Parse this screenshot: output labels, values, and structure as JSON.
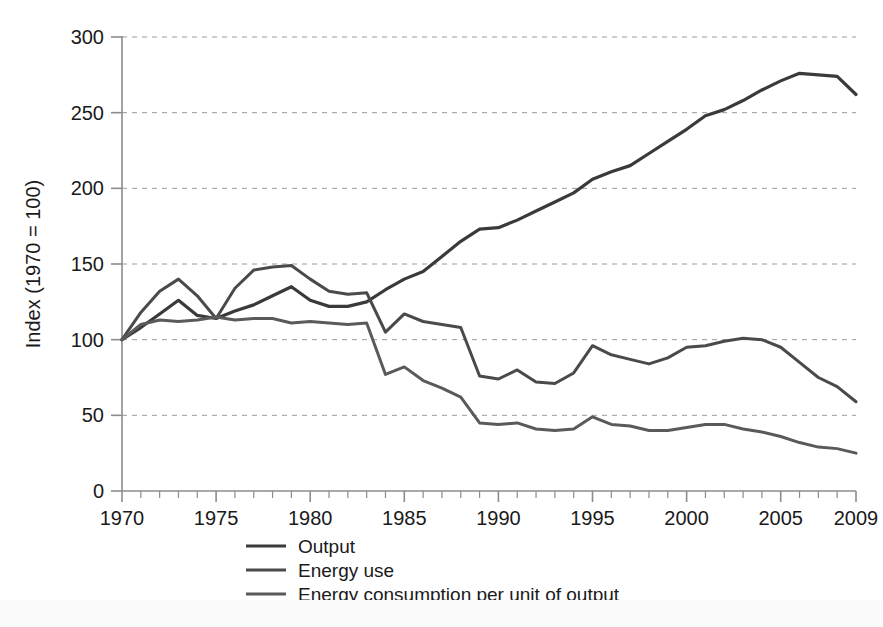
{
  "figure": {
    "background_color": "#ffffff",
    "axis_color": "#8c8c8c",
    "grid_color": "#9a9aa0",
    "text_color": "#1a1a1a"
  },
  "chart_data": {
    "type": "line",
    "title": "",
    "subtitle": "",
    "xlabel": "",
    "ylabel": "Index (1970 = 100)",
    "xlim": [
      1970,
      2009
    ],
    "ylim": [
      0,
      300
    ],
    "grid": true,
    "grid_axis": "y",
    "grid_style": "dashed",
    "legend_position": "bottom-center",
    "xticks": [
      1970,
      1975,
      1980,
      1985,
      1990,
      1995,
      2000,
      2005,
      2009
    ],
    "xtick_labels": [
      "1970",
      "1975",
      "1980",
      "1985",
      "1990",
      "1995",
      "2000",
      "2005",
      "2009"
    ],
    "xminor_tick_interval": 1,
    "yticks": [
      0,
      50,
      100,
      150,
      200,
      250,
      300
    ],
    "ytick_labels": [
      "0",
      "50",
      "100",
      "150",
      "200",
      "250",
      "300"
    ],
    "x": [
      1970,
      1971,
      1972,
      1973,
      1974,
      1975,
      1976,
      1977,
      1978,
      1979,
      1980,
      1981,
      1982,
      1983,
      1984,
      1985,
      1986,
      1987,
      1988,
      1989,
      1990,
      1991,
      1992,
      1993,
      1994,
      1995,
      1996,
      1997,
      1998,
      1999,
      2000,
      2001,
      2002,
      2003,
      2004,
      2005,
      2006,
      2007,
      2008,
      2009
    ],
    "series": [
      {
        "name": "Output",
        "color": "#3a3a3a",
        "width": 3.2,
        "values": [
          100,
          108,
          117,
          126,
          116,
          114,
          119,
          123,
          129,
          135,
          126,
          122,
          122,
          125,
          133,
          140,
          145,
          155,
          165,
          173,
          174,
          179,
          185,
          191,
          197,
          206,
          211,
          215,
          223,
          231,
          239,
          248,
          252,
          258,
          265,
          271,
          276,
          275,
          274,
          262
        ]
      },
      {
        "name": "Energy use",
        "color": "#4a4a4a",
        "width": 3.0,
        "values": [
          100,
          118,
          132,
          140,
          129,
          114,
          134,
          146,
          148,
          149,
          140,
          132,
          130,
          131,
          105,
          117,
          112,
          110,
          108,
          76,
          74,
          80,
          72,
          71,
          78,
          96,
          90,
          87,
          84,
          88,
          95,
          96,
          99,
          101,
          100,
          95,
          85,
          75,
          69,
          59
        ]
      },
      {
        "name": "Energy consumption per unit of output",
        "color": "#5a5a5a",
        "width": 3.0,
        "values": [
          100,
          110,
          113,
          112,
          113,
          115,
          113,
          114,
          114,
          111,
          112,
          111,
          110,
          111,
          77,
          82,
          73,
          68,
          62,
          45,
          44,
          45,
          41,
          40,
          41,
          49,
          44,
          43,
          40,
          40,
          42,
          44,
          44,
          41,
          39,
          36,
          32,
          29,
          28,
          25
        ]
      }
    ]
  },
  "legend": {
    "items": [
      {
        "label": "Output",
        "color": "#3a3a3a"
      },
      {
        "label": "Energy use",
        "color": "#4a4a4a"
      },
      {
        "label": "Energy consumption per unit of output",
        "color": "#5a5a5a"
      }
    ]
  }
}
